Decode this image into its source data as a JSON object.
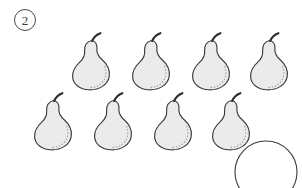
{
  "worksheet": {
    "item_label": "2",
    "item_label_shape": "circled-number",
    "background_color": "#ffffff"
  },
  "objects": {
    "name": "pear",
    "icon": "pear-icon",
    "total_count": 8,
    "fill_color": "#ebebeb",
    "outline_color": "#3c3c3c",
    "stem_color": "#2e2e2e",
    "stipple_color": "#9a9a9a",
    "rows": [
      {
        "row_index": 0,
        "count": 4,
        "items": [
          {
            "index": 1,
            "x": 66,
            "y": 30
          },
          {
            "index": 2,
            "x": 126,
            "y": 30
          },
          {
            "index": 3,
            "x": 186,
            "y": 30
          },
          {
            "index": 4,
            "x": 244,
            "y": 30
          }
        ]
      },
      {
        "row_index": 1,
        "count": 4,
        "items": [
          {
            "index": 5,
            "x": 28,
            "y": 90
          },
          {
            "index": 6,
            "x": 88,
            "y": 90
          },
          {
            "index": 7,
            "x": 148,
            "y": 90
          },
          {
            "index": 8,
            "x": 206,
            "y": 90
          }
        ]
      }
    ]
  },
  "answer_placeholder": {
    "name": "empty-answer-circle",
    "x": 234,
    "y": 140,
    "diameter": 64,
    "outline_color": "#3c3c3c",
    "fill_color": "#ffffff",
    "clipped_by_bottom_edge": true
  }
}
